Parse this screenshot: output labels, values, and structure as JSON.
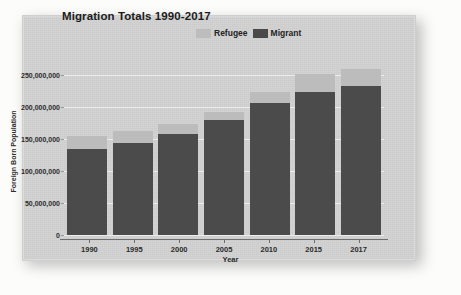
{
  "card": {
    "background_color": "#d2d2d2"
  },
  "chart_data": {
    "type": "bar",
    "subtype": "stacked-bar",
    "title": "Migration Totals 1990-2017",
    "xlabel": "Year",
    "ylabel": "Foreign Born Population",
    "categories": [
      "1990",
      "1995",
      "2000",
      "2005",
      "2010",
      "2015",
      "2017"
    ],
    "series": [
      {
        "name": "Migrant",
        "color": "#4b4b4b",
        "values": [
          133000000,
          142000000,
          156000000,
          178000000,
          204000000,
          221000000,
          230000000
        ]
      },
      {
        "name": "Refugee",
        "color": "#bcbcbc",
        "values": [
          19000000,
          18000000,
          16000000,
          12000000,
          16000000,
          27000000,
          26000000
        ]
      }
    ],
    "totals": [
      152000000,
      160000000,
      172000000,
      190000000,
      220000000,
      248000000,
      256000000
    ],
    "ylim": [
      0,
      270000000
    ],
    "ytick_values": [
      0,
      50000000,
      100000000,
      150000000,
      200000000,
      250000000
    ],
    "ytick_labels": [
      "0",
      "50,000,000",
      "100,000,000",
      "150,000,000",
      "200,000,000",
      "250,000,000"
    ],
    "grid": true,
    "gridline_color": "#f2f2f2",
    "legend_position": "top-right",
    "legend": [
      {
        "label": "Refugee",
        "color": "#bcbcbc"
      },
      {
        "label": "Migrant",
        "color": "#4b4b4b"
      }
    ]
  }
}
